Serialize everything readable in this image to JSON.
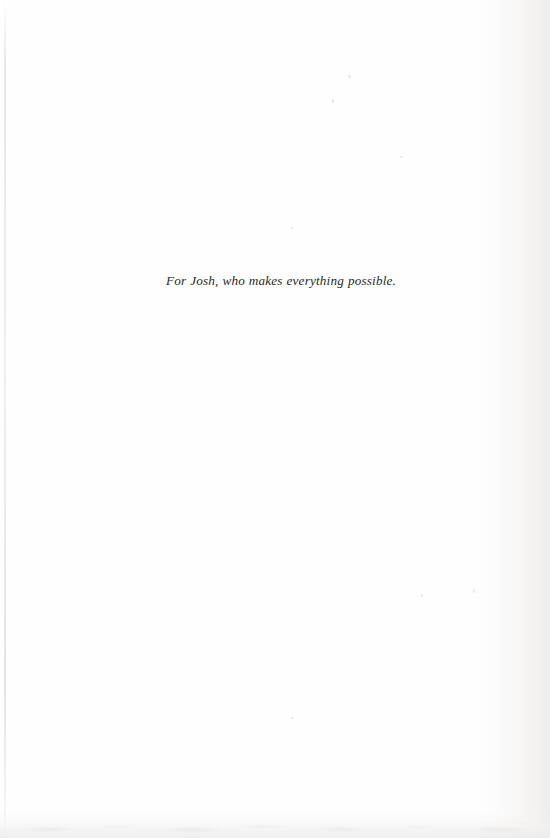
{
  "page": {
    "kind": "book-dedication-page",
    "width": 550,
    "height": 838,
    "background_color": "#fefefe",
    "ink_color": "#2a2826"
  },
  "dedication": {
    "text": "For Josh, who makes everything possible."
  },
  "artifacts": {
    "left_edge_line_color": "#dedee2",
    "right_edge_shade_color": "#eeeceA",
    "bottom_band_color": "#ecebea"
  }
}
